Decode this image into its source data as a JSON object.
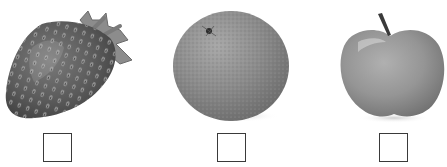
{
  "items": [
    {
      "name": "strawberry",
      "icon": "strawberry-icon",
      "checked": false
    },
    {
      "name": "orange",
      "icon": "orange-icon",
      "checked": false
    },
    {
      "name": "apple",
      "icon": "apple-icon",
      "checked": false
    }
  ],
  "colors": {
    "background": "#ffffff",
    "checkbox_border": "#3a3a3a",
    "strawberry_body": "#5e5e5e",
    "orange_body": "#8a8a8a",
    "apple_body": "#9a9a9a"
  }
}
